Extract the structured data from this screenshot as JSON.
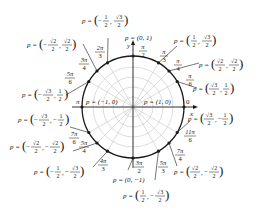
{
  "diagram": {
    "center": [
      133,
      107
    ],
    "radius": 51,
    "axis_labels": {
      "x": "x",
      "y": "y"
    },
    "colors": {
      "circle": "#1a1a1a",
      "grid": "#c8c8c8",
      "text": "#1a1a1a",
      "background": "#ffffff"
    },
    "points": [
      {
        "angle_deg": 0,
        "angle_label": "0",
        "point": "p = (1, 0)"
      },
      {
        "angle_deg": 30,
        "angle_label": "π/6",
        "point": "p = (√3/2, 1/2)"
      },
      {
        "angle_deg": 45,
        "angle_label": "π/4",
        "point": "p = (√2/2, √2/2)"
      },
      {
        "angle_deg": 60,
        "angle_label": "π/3",
        "point": "p = (1/2, √3/2)"
      },
      {
        "angle_deg": 90,
        "angle_label": "π/2",
        "point": "p = (0, 1)"
      },
      {
        "angle_deg": 120,
        "angle_label": "2π/3",
        "point": "p = (−1/2, √3/2)"
      },
      {
        "angle_deg": 135,
        "angle_label": "3π/4",
        "point": "p = (−√2/2, √2/2)"
      },
      {
        "angle_deg": 150,
        "angle_label": "5π/6",
        "point": "p = (−√3/2, 1/2)"
      },
      {
        "angle_deg": 180,
        "angle_label": "π",
        "point": "p = (−1, 0)"
      },
      {
        "angle_deg": 210,
        "angle_label": "7π/6",
        "point": "p = (−√3/2, −1/2)"
      },
      {
        "angle_deg": 225,
        "angle_label": "5π/4",
        "point": "p = (−√2/2, −√2/2)"
      },
      {
        "angle_deg": 240,
        "angle_label": "4π/3",
        "point": "p = (−1/2, −√3/2)"
      },
      {
        "angle_deg": 270,
        "angle_label": "3π/2",
        "point": "p = (0, −1)"
      },
      {
        "angle_deg": 300,
        "angle_label": "5π/3",
        "point": "p = (1/2, −√3/2)"
      },
      {
        "angle_deg": 315,
        "angle_label": "7π/4",
        "point": "p = (√2/2, −√2/2)"
      },
      {
        "angle_deg": 330,
        "angle_label": "11π/6",
        "point": "p = (√3/2, −1/2)"
      }
    ],
    "text": {
      "p_eq": "p =",
      "axis_x": "x",
      "axis_y": "y",
      "pi": "π",
      "zero": "0",
      "p_1_0": "p = (1, 0)",
      "p_m1_0": "p = (−1, 0)",
      "p_0_1": "p = (0, 1)",
      "p_0_m1": "p = (0, −1)",
      "pi_num": "π",
      "n2pi": "2π",
      "n3pi": "3π",
      "n4pi": "4π",
      "n5pi": "5π",
      "n7pi": "7π",
      "n11pi": "11π",
      "d2": "2",
      "d3": "3",
      "d4": "4",
      "d6": "6",
      "half": "1",
      "sqrt2": "√2",
      "sqrt3": "√3",
      "minus": "−",
      "comma": ",",
      "lparen": "(",
      "rparen": ")"
    }
  }
}
